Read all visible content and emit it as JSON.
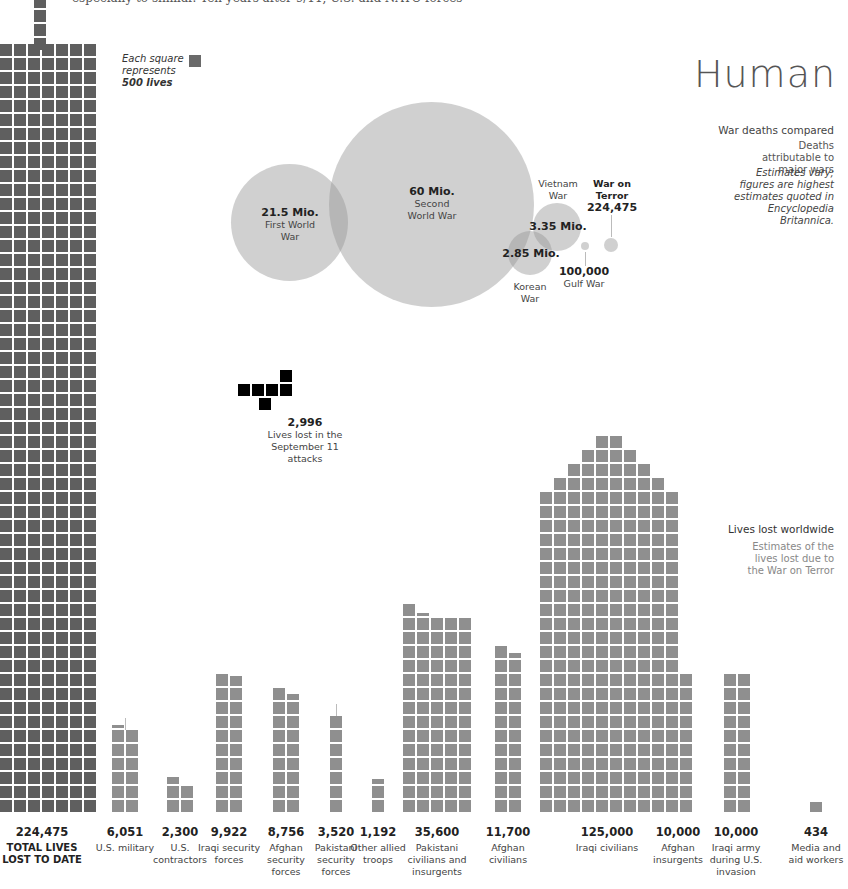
{
  "intro_text": "especially to similar. Ten years after 9/11, U.S. and NATO forces",
  "legend": {
    "line1": "Each square",
    "line2": "represents",
    "line3": "500 lives"
  },
  "title": "Human",
  "war_deaths": {
    "heading": "War deaths compared",
    "subheading": "Deaths attributable to major wars",
    "note": "Estimates vary; figures are highest estimates quoted in Encyclopedia Britannica."
  },
  "worldwide": {
    "heading": "Lives lost worldwide",
    "subheading": "Estimates of the lives lost due to the War on Terror"
  },
  "sept11": {
    "value": "2,996",
    "label": "Lives lost in the September 11 attacks"
  },
  "colors": {
    "total": "#5f5f5f",
    "category": "#8f8f8f",
    "sept11": "#000000",
    "bubble": "#969696"
  },
  "chart_data": [
    {
      "type": "bubble",
      "title": "War deaths compared",
      "series": [
        {
          "name": "First World War",
          "label": "21.5 Mio.",
          "value": 21500000
        },
        {
          "name": "Second World War",
          "label": "60 Mio.",
          "value": 60000000
        },
        {
          "name": "Vietnam War",
          "label": "3.35 Mio.",
          "value": 3350000
        },
        {
          "name": "Korean War",
          "label": "2.85 Mio.",
          "value": 2850000
        },
        {
          "name": "Gulf War",
          "label": "100,000",
          "value": 100000
        },
        {
          "name": "War on Terror",
          "label": "224,475",
          "value": 224475
        }
      ]
    },
    {
      "type": "waffle",
      "title": "Lives lost worldwide",
      "unit": "Each square represents 500 lives",
      "categories": [
        "TOTAL LIVES LOST TO DATE",
        "U.S. military",
        "U.S. contractors",
        "Iraqi security forces",
        "Afghan security forces",
        "Pakistani security forces",
        "Other allied troops",
        "Pakistani civilians and insurgents",
        "Afghan civilians",
        "Iraqi civilians",
        "Afghan insurgents",
        "Iraqi army during U.S. invasion",
        "Media and aid workers"
      ],
      "values": [
        224475,
        6051,
        2300,
        9922,
        8756,
        3520,
        1192,
        35600,
        11700,
        125000,
        10000,
        10000,
        434
      ],
      "labels": [
        "224,475",
        "6,051",
        "2,300",
        "9,922",
        "8,756",
        "3,520",
        "1,192",
        "35,600",
        "11,700",
        "125,000",
        "10,000",
        "10,000",
        "434"
      ],
      "annotation": {
        "value": 2996,
        "label": "2,996 Lives lost in the September 11 attacks"
      }
    }
  ],
  "bottom_labels": [
    {
      "value": "224,475",
      "label": "TOTAL LIVES LOST TO DATE",
      "x": 42,
      "total": true
    },
    {
      "value": "6,051",
      "label": "U.S. military",
      "x": 125
    },
    {
      "value": "2,300",
      "label": "U.S. contractors",
      "x": 180
    },
    {
      "value": "9,922",
      "label": "Iraqi security forces",
      "x": 229
    },
    {
      "value": "8,756",
      "label": "Afghan security forces",
      "x": 286
    },
    {
      "value": "3,520",
      "label": "Pakistani security forces",
      "x": 336
    },
    {
      "value": "1,192",
      "label": "Other allied troops",
      "x": 378
    },
    {
      "value": "35,600",
      "label": "Pakistani civilians and insurgents",
      "x": 437
    },
    {
      "value": "11,700",
      "label": "Afghan civilians",
      "x": 508
    },
    {
      "value": "125,000",
      "label": "Iraqi civilians",
      "x": 607
    },
    {
      "value": "10,000",
      "label": "Afghan insurgents",
      "x": 678
    },
    {
      "value": "10,000",
      "label": "Iraqi army during U.S. invasion",
      "x": 736
    },
    {
      "value": "434",
      "label": "Media and aid workers",
      "x": 816
    }
  ]
}
